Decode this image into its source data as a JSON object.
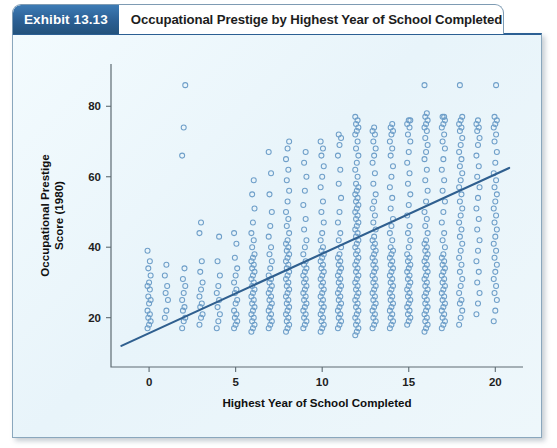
{
  "exhibit": {
    "badge_label": "Exhibit 13.13",
    "title": "Occupational Prestige by Highest Year of School Completed",
    "badge_color": "#2b5f93",
    "panel_bg": "#eaf4fa",
    "border_color": "#8aa7bd"
  },
  "chart_data": {
    "type": "scatter",
    "title": "Occupational Prestige by Highest Year of School Completed",
    "xlabel": "Highest Year of School Completed",
    "ylabel": "Occupational Prestige Score (1980)",
    "xlim": [
      -2.2,
      21.6
    ],
    "ylim": [
      6,
      92
    ],
    "xticks": [
      0,
      5,
      10,
      15,
      20
    ],
    "xtick_labels": [
      "0",
      "5",
      "10",
      "15",
      "20"
    ],
    "yticks": [
      20,
      40,
      60,
      80
    ],
    "ytick_labels": [
      "20",
      "40",
      "60",
      "80"
    ],
    "grid": false,
    "legend": "none",
    "marker": "open-circle",
    "marker_color": "#6f9fc9",
    "regression_line": {
      "color": "#2f5f8f",
      "x_start": -1.6,
      "y_start": 12.0,
      "x_end": 20.8,
      "y_end": 62.5,
      "slope": 2.25,
      "intercept": 15.6
    },
    "columns": [
      {
        "x": 0,
        "count": 16,
        "y_min": 17,
        "y_max": 39,
        "values": [
          17,
          18,
          19,
          20,
          21,
          22,
          24,
          25,
          26,
          28,
          29,
          30,
          32,
          34,
          36,
          39
        ]
      },
      {
        "x": 1,
        "count": 7,
        "y_min": 20,
        "y_max": 35,
        "values": [
          20,
          22,
          25,
          27,
          29,
          32,
          35
        ]
      },
      {
        "x": 2,
        "count": 13,
        "y_min": 17,
        "y_max": 86,
        "values": [
          17,
          19,
          20,
          22,
          23,
          25,
          27,
          29,
          31,
          34,
          66,
          74,
          86
        ]
      },
      {
        "x": 3,
        "count": 12,
        "y_min": 18,
        "y_max": 47,
        "values": [
          18,
          20,
          21,
          23,
          24,
          26,
          28,
          30,
          33,
          36,
          44,
          47
        ]
      },
      {
        "x": 4,
        "count": 10,
        "y_min": 17,
        "y_max": 43,
        "values": [
          17,
          19,
          21,
          23,
          25,
          27,
          29,
          32,
          36,
          43
        ]
      },
      {
        "x": 5,
        "count": 16,
        "y_min": 17,
        "y_max": 44,
        "values": [
          17,
          18,
          19,
          20,
          21,
          22,
          24,
          25,
          27,
          28,
          30,
          32,
          34,
          37,
          41,
          44
        ]
      },
      {
        "x": 6,
        "count": 30,
        "y_min": 16,
        "y_max": 59,
        "values": [
          16,
          17,
          18,
          19,
          20,
          21,
          22,
          23,
          24,
          25,
          26,
          27,
          28,
          29,
          30,
          31,
          32,
          33,
          34,
          35,
          36,
          37,
          38,
          40,
          42,
          44,
          47,
          51,
          55,
          59
        ]
      },
      {
        "x": 7,
        "count": 26,
        "y_min": 17,
        "y_max": 67,
        "values": [
          17,
          18,
          19,
          20,
          21,
          22,
          23,
          24,
          25,
          26,
          27,
          28,
          29,
          30,
          31,
          32,
          34,
          36,
          38,
          40,
          43,
          46,
          50,
          55,
          61,
          67
        ]
      },
      {
        "x": 8,
        "count": 38,
        "y_min": 16,
        "y_max": 70,
        "values": [
          16,
          17,
          18,
          19,
          20,
          21,
          22,
          23,
          24,
          25,
          26,
          27,
          28,
          29,
          30,
          31,
          32,
          33,
          34,
          35,
          36,
          37,
          38,
          39,
          40,
          41,
          42,
          44,
          46,
          48,
          50,
          53,
          56,
          59,
          62,
          65,
          68,
          70
        ]
      },
      {
        "x": 9,
        "count": 30,
        "y_min": 17,
        "y_max": 67,
        "values": [
          17,
          18,
          19,
          20,
          21,
          22,
          23,
          24,
          25,
          26,
          27,
          28,
          29,
          30,
          31,
          32,
          33,
          34,
          35,
          36,
          38,
          40,
          42,
          45,
          48,
          52,
          56,
          60,
          64,
          67
        ]
      },
      {
        "x": 10,
        "count": 36,
        "y_min": 16,
        "y_max": 70,
        "values": [
          16,
          17,
          18,
          19,
          20,
          21,
          22,
          23,
          24,
          25,
          26,
          27,
          28,
          29,
          30,
          31,
          32,
          33,
          34,
          35,
          36,
          37,
          38,
          39,
          40,
          42,
          44,
          47,
          50,
          53,
          57,
          60,
          63,
          66,
          68,
          70
        ]
      },
      {
        "x": 11,
        "count": 34,
        "y_min": 17,
        "y_max": 72,
        "values": [
          17,
          18,
          19,
          20,
          21,
          22,
          23,
          24,
          25,
          26,
          27,
          28,
          29,
          30,
          31,
          32,
          33,
          34,
          35,
          36,
          37,
          38,
          40,
          42,
          44,
          47,
          50,
          54,
          58,
          62,
          66,
          69,
          71,
          72
        ]
      },
      {
        "x": 12,
        "count": 56,
        "y_min": 15,
        "y_max": 77,
        "values": [
          15,
          16,
          17,
          18,
          19,
          20,
          21,
          22,
          23,
          24,
          25,
          26,
          27,
          28,
          29,
          30,
          31,
          32,
          33,
          34,
          35,
          36,
          37,
          38,
          39,
          40,
          41,
          42,
          43,
          44,
          45,
          46,
          47,
          48,
          49,
          50,
          51,
          52,
          53,
          54,
          55,
          56,
          57,
          58,
          60,
          62,
          64,
          66,
          68,
          70,
          72,
          73,
          74,
          75,
          76,
          77
        ]
      },
      {
        "x": 13,
        "count": 42,
        "y_min": 17,
        "y_max": 74,
        "values": [
          17,
          18,
          19,
          20,
          21,
          22,
          23,
          24,
          25,
          26,
          27,
          28,
          29,
          30,
          31,
          32,
          33,
          34,
          35,
          36,
          37,
          38,
          39,
          40,
          41,
          42,
          43,
          45,
          47,
          49,
          51,
          53,
          55,
          58,
          61,
          64,
          66,
          68,
          70,
          72,
          73,
          74
        ]
      },
      {
        "x": 14,
        "count": 40,
        "y_min": 17,
        "y_max": 75,
        "values": [
          17,
          18,
          19,
          20,
          21,
          22,
          23,
          24,
          25,
          26,
          27,
          28,
          29,
          30,
          31,
          32,
          33,
          34,
          35,
          36,
          37,
          38,
          39,
          40,
          42,
          44,
          46,
          48,
          51,
          54,
          57,
          60,
          63,
          66,
          68,
          70,
          72,
          73,
          74,
          75
        ]
      },
      {
        "x": 15,
        "count": 38,
        "y_min": 18,
        "y_max": 76,
        "values": [
          18,
          19,
          20,
          21,
          22,
          23,
          24,
          25,
          26,
          27,
          28,
          29,
          30,
          31,
          32,
          33,
          34,
          35,
          36,
          37,
          38,
          40,
          42,
          44,
          46,
          49,
          52,
          55,
          58,
          61,
          64,
          67,
          70,
          72,
          74,
          75,
          76,
          76
        ]
      },
      {
        "x": 16,
        "count": 46,
        "y_min": 16,
        "y_max": 86,
        "values": [
          16,
          17,
          18,
          19,
          20,
          21,
          22,
          23,
          24,
          25,
          26,
          27,
          28,
          29,
          30,
          31,
          32,
          33,
          34,
          35,
          36,
          37,
          38,
          39,
          40,
          41,
          42,
          44,
          46,
          48,
          50,
          53,
          56,
          59,
          62,
          65,
          67,
          69,
          71,
          73,
          74,
          75,
          76,
          77,
          78,
          86
        ]
      },
      {
        "x": 17,
        "count": 40,
        "y_min": 17,
        "y_max": 77,
        "values": [
          17,
          18,
          19,
          20,
          21,
          22,
          23,
          24,
          25,
          26,
          27,
          28,
          29,
          30,
          31,
          32,
          33,
          34,
          35,
          36,
          37,
          38,
          40,
          42,
          44,
          47,
          50,
          53,
          56,
          59,
          62,
          65,
          68,
          70,
          72,
          74,
          75,
          76,
          77,
          77
        ]
      },
      {
        "x": 18,
        "count": 34,
        "y_min": 18,
        "y_max": 86,
        "values": [
          18,
          20,
          22,
          24,
          25,
          27,
          29,
          31,
          33,
          35,
          37,
          39,
          41,
          43,
          45,
          47,
          49,
          51,
          53,
          55,
          57,
          59,
          61,
          63,
          65,
          67,
          69,
          71,
          73,
          74,
          75,
          76,
          77,
          86
        ]
      },
      {
        "x": 19,
        "count": 22,
        "y_min": 21,
        "y_max": 76,
        "values": [
          21,
          24,
          27,
          30,
          33,
          36,
          39,
          42,
          45,
          48,
          51,
          54,
          57,
          60,
          63,
          66,
          69,
          71,
          73,
          74,
          75,
          76
        ]
      },
      {
        "x": 20,
        "count": 30,
        "y_min": 19,
        "y_max": 86,
        "values": [
          19,
          22,
          25,
          27,
          29,
          31,
          33,
          35,
          37,
          39,
          41,
          43,
          45,
          47,
          49,
          51,
          53,
          55,
          57,
          59,
          61,
          64,
          67,
          70,
          72,
          74,
          75,
          76,
          77,
          86
        ]
      }
    ]
  }
}
